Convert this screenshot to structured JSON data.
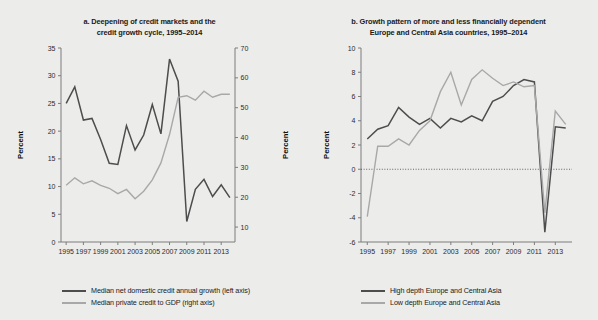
{
  "figure": {
    "background_color": "#ececeb",
    "dark_series_color": "#4d4d4d",
    "light_series_color": "#a8a8a8"
  },
  "panel_a": {
    "title": "a. Deepening of credit markets and the credit growth cycle, 1995–2014",
    "title_line1": "a. Deepening of credit markets and the",
    "title_line2": "credit growth cycle, 1995–2014",
    "y_left_label": "Percent",
    "y_right_label": "Percent",
    "legend": [
      {
        "label": "Median net domestic credit annual growth (left axis)",
        "color": "#4d4d4d"
      },
      {
        "label": "Median private credit to GDP (right axis)",
        "color": "#a8a8a8"
      }
    ]
  },
  "panel_b": {
    "title": "b. Growth pattern of more and less financially dependent Europe and Central Asia countries, 1995–2014",
    "title_line1": "b. Growth pattern of more and less financially dependent",
    "title_line2": "Europe and Central Asia countries, 1995–2014",
    "y_label": "Percent",
    "legend": [
      {
        "label": "High depth Europe and Central Asia",
        "color": "#4d4d4d"
      },
      {
        "label": "Low depth Europe and Central Asia",
        "color": "#a8a8a8"
      }
    ]
  },
  "chart_data": [
    {
      "id": "panel-a",
      "type": "line",
      "title": "a. Deepening of credit markets and the credit growth cycle, 1995–2014",
      "xlabel": "",
      "ylabel": "Percent",
      "y2label": "Percent",
      "x": [
        1995,
        1996,
        1997,
        1998,
        1999,
        2000,
        2001,
        2002,
        2003,
        2004,
        2005,
        2006,
        2007,
        2008,
        2009,
        2010,
        2011,
        2012,
        2013,
        2014
      ],
      "xlim": [
        1994.4,
        2014.6
      ],
      "xticks": [
        1995,
        1997,
        1999,
        2001,
        2003,
        2005,
        2007,
        2009,
        2011,
        2013
      ],
      "ylim": [
        0,
        35
      ],
      "yticks": [
        0,
        5,
        10,
        15,
        20,
        25,
        30,
        35
      ],
      "y2lim": [
        5,
        70
      ],
      "y2ticks": [
        10,
        20,
        30,
        40,
        50,
        60,
        70
      ],
      "grid": false,
      "legend_position": "bottom",
      "series": [
        {
          "name": "Median net domestic credit annual growth (left axis)",
          "axis": "left",
          "color": "#4d4d4d",
          "values": [
            25.0,
            28.0,
            22.0,
            22.3,
            18.5,
            14.2,
            14.0,
            21.0,
            16.6,
            19.3,
            24.8,
            19.5,
            33.0,
            29.0,
            3.7,
            9.5,
            11.3,
            8.2,
            10.3,
            8.0
          ]
        },
        {
          "name": "Median private credit to GDP (right axis)",
          "axis": "right",
          "color": "#a8a8a8",
          "values": [
            24.0,
            26.5,
            24.5,
            25.5,
            24.0,
            23.0,
            21.2,
            22.6,
            19.5,
            22.0,
            25.8,
            31.5,
            41.0,
            53.5,
            54.0,
            52.5,
            55.5,
            53.5,
            54.5,
            54.5
          ]
        }
      ]
    },
    {
      "id": "panel-b",
      "type": "line",
      "title": "b. Growth pattern of more and less financially dependent Europe and Central Asia countries, 1995–2014",
      "xlabel": "",
      "ylabel": "Percent",
      "x": [
        1995,
        1996,
        1997,
        1998,
        1999,
        2000,
        2001,
        2002,
        2003,
        2004,
        2005,
        2006,
        2007,
        2008,
        2009,
        2010,
        2011,
        2012,
        2013,
        2014
      ],
      "xlim": [
        1994.4,
        2014.6
      ],
      "xticks": [
        1995,
        1997,
        1999,
        2001,
        2003,
        2005,
        2007,
        2009,
        2011,
        2013
      ],
      "ylim": [
        -6,
        10
      ],
      "yticks": [
        -6,
        -4,
        -2,
        0,
        2,
        4,
        6,
        8,
        10
      ],
      "zero_line": true,
      "grid": false,
      "legend_position": "bottom",
      "series": [
        {
          "name": "High depth Europe and Central Asia",
          "axis": "left",
          "color": "#4d4d4d",
          "values": [
            2.5,
            3.3,
            3.6,
            5.1,
            4.3,
            3.7,
            4.2,
            3.4,
            4.2,
            3.9,
            4.4,
            4.0,
            5.6,
            6.0,
            6.9,
            7.4,
            7.2,
            -5.2,
            3.5,
            3.4
          ]
        },
        {
          "name": "Low depth Europe and Central Asia",
          "axis": "left",
          "color": "#a8a8a8",
          "values": [
            -3.9,
            1.9,
            1.9,
            2.5,
            2.0,
            3.2,
            4.0,
            6.4,
            8.0,
            5.3,
            7.4,
            8.2,
            7.5,
            6.9,
            7.2,
            6.8,
            6.9,
            -3.6,
            4.8,
            3.7
          ]
        }
      ]
    }
  ]
}
